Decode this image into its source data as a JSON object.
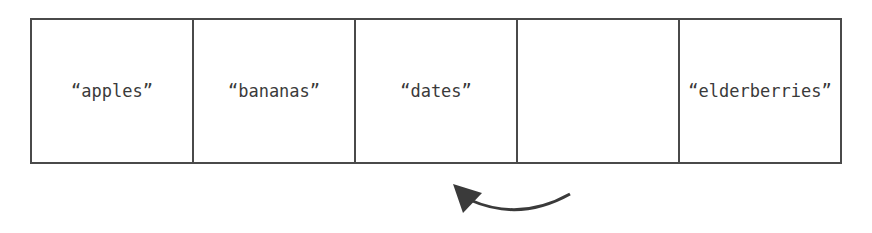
{
  "array": {
    "cells": [
      {
        "label": "“apples”"
      },
      {
        "label": "“bananas”"
      },
      {
        "label": "“dates”"
      },
      {
        "label": ""
      },
      {
        "label": "“elderberries”"
      }
    ]
  },
  "arrow": {
    "icon": "curved-arrow-left-icon",
    "color": "#3a3a3a"
  }
}
